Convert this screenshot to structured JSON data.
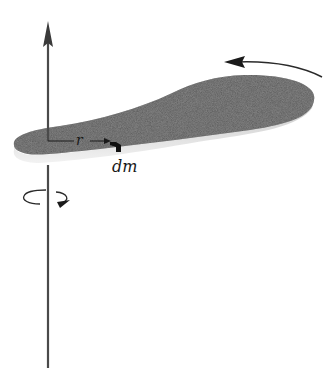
{
  "diagram": {
    "labels": {
      "radius": "r",
      "mass_element": "dm"
    },
    "icons": {
      "axis_arrow": "up-arrow",
      "rotation_indicator": "circular-arrow-counterclockwise",
      "motion_arrow": "curved-arrow-left"
    },
    "colors": {
      "background": "#ffffff",
      "body_top": "#5a5a5a",
      "body_edge": "#e2e2e2",
      "axis": "#4a4a4a",
      "ink": "#1a1a1a"
    }
  }
}
